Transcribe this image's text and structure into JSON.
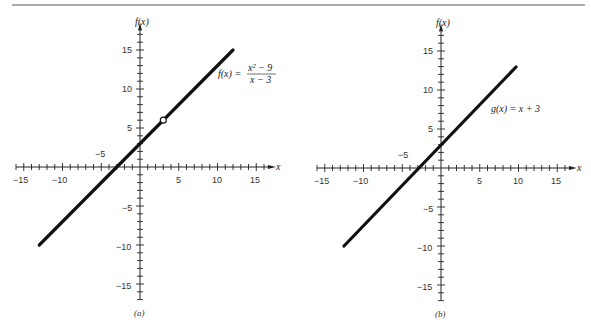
{
  "figure": {
    "top_rule": true,
    "panels": [
      {
        "id": "a",
        "caption": "(a)",
        "y_axis_title": "f(x)",
        "x_axis_title": "x",
        "function_label": "f(x) =",
        "function_numerator": "x² − 9",
        "function_denominator": "x − 3",
        "x_tick_labels": [
          "−15",
          "−10",
          "5",
          "10",
          "15"
        ],
        "y_tick_labels": [
          "15",
          "10",
          "5",
          "−5",
          "−10",
          "−15"
        ],
        "stray_label": "−5",
        "hole": {
          "x": 3,
          "y": 6
        }
      },
      {
        "id": "b",
        "caption": "(b)",
        "y_axis_title": "f(x)",
        "x_axis_title": "x",
        "function_label": "g(x) = x + 3",
        "x_tick_labels": [
          "−15",
          "−10",
          "5",
          "10",
          "15"
        ],
        "y_tick_labels": [
          "15",
          "10",
          "5",
          "−5",
          "−10",
          "−15"
        ],
        "stray_label": "−5"
      }
    ]
  },
  "chart_data": [
    {
      "type": "line",
      "title": "(a) f(x) = (x² − 9)/(x − 3)",
      "xlabel": "x",
      "ylabel": "f(x)",
      "xlim": [
        -16,
        16
      ],
      "ylim": [
        -17,
        17
      ],
      "grid": false,
      "x": [
        -13,
        12
      ],
      "series": [
        {
          "name": "f(x) = (x² − 9)/(x − 3)",
          "values": [
            -10,
            15
          ]
        }
      ],
      "annotations": [
        {
          "type": "open-circle",
          "x": 3,
          "y": 6,
          "text": "hole (undefined at x = 3)"
        }
      ],
      "x_ticks": [
        -15,
        -10,
        5,
        10,
        15
      ],
      "y_ticks": [
        -15,
        -10,
        -5,
        5,
        10,
        15
      ]
    },
    {
      "type": "line",
      "title": "(b) g(x) = x + 3",
      "xlabel": "x",
      "ylabel": "f(x)",
      "xlim": [
        -16,
        16
      ],
      "ylim": [
        -17,
        17
      ],
      "grid": false,
      "x": [
        -13,
        10
      ],
      "series": [
        {
          "name": "g(x) = x + 3",
          "values": [
            -10,
            13
          ]
        }
      ],
      "x_ticks": [
        -15,
        -10,
        5,
        10,
        15
      ],
      "y_ticks": [
        -15,
        -10,
        -5,
        5,
        10,
        15
      ]
    }
  ]
}
